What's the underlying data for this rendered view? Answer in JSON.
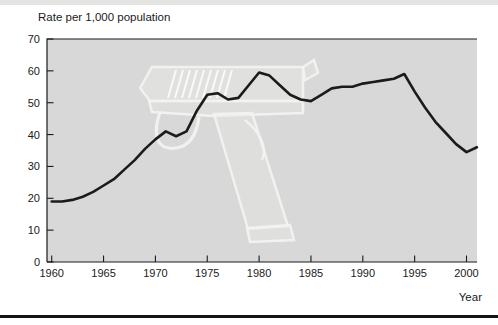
{
  "title": "Rate per 1,000 population",
  "xlabel": "Year",
  "watermark": "handgun",
  "colors": {
    "plot_background": "#d8d8d8",
    "line": "#1b1b1b",
    "text": "#1a1a1a",
    "page_rule": "#141414"
  },
  "chart_data": {
    "type": "line",
    "title": "Rate per 1,000 population",
    "xlabel": "Year",
    "ylabel": "",
    "xlim": [
      1960,
      2001
    ],
    "ylim": [
      0,
      70
    ],
    "xticks": [
      1960,
      1965,
      1970,
      1975,
      1980,
      1985,
      1990,
      1995,
      2000
    ],
    "yticks": [
      0,
      10,
      20,
      30,
      40,
      50,
      60,
      70
    ],
    "grid": false,
    "legend": null,
    "x": [
      1960,
      1961,
      1962,
      1963,
      1964,
      1965,
      1966,
      1967,
      1968,
      1969,
      1970,
      1971,
      1972,
      1973,
      1974,
      1975,
      1976,
      1977,
      1978,
      1979,
      1980,
      1981,
      1982,
      1983,
      1984,
      1985,
      1986,
      1987,
      1988,
      1989,
      1990,
      1991,
      1992,
      1993,
      1994,
      1995,
      1996,
      1997,
      1998,
      1999,
      2000,
      2001
    ],
    "series": [
      {
        "name": "Rate per 1,000 population",
        "values": [
          19,
          19,
          19.5,
          20.5,
          22,
          24,
          26,
          29,
          32,
          35.5,
          38.5,
          41,
          39.5,
          41,
          47.5,
          52.5,
          53,
          51,
          51.5,
          55.5,
          59.5,
          58.5,
          55.5,
          52.5,
          51,
          50.5,
          52.5,
          54.5,
          55,
          55,
          56,
          56.5,
          57,
          57.5,
          59,
          53.5,
          48.5,
          44,
          40.5,
          37,
          34.5,
          36
        ]
      }
    ]
  }
}
